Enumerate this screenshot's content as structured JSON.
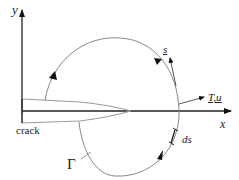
{
  "diagram": {
    "labels": {
      "y_axis": "y",
      "x_axis": "x",
      "crack": "crack",
      "contour": "Γ",
      "path_tangent": "s",
      "traction_displacement": "T,u",
      "arc_element": "ds"
    },
    "colors": {
      "axis": "#222222",
      "contour": "#888888",
      "crack_outline": "#999999",
      "arrowhead": "#111111"
    }
  }
}
